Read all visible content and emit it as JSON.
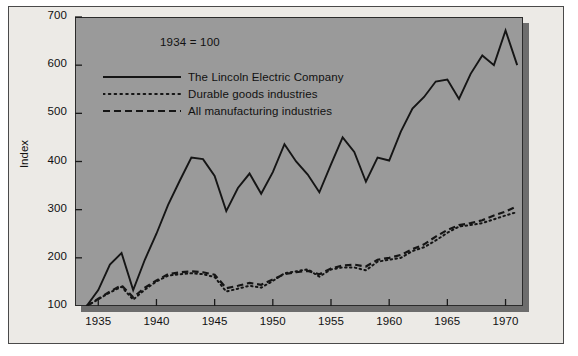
{
  "chart_data": {
    "type": "line",
    "title": "",
    "subtitle": "",
    "annotation": "1934 = 100",
    "xlabel": "",
    "ylabel": "Index",
    "xlim": [
      1933,
      1971.5
    ],
    "ylim": [
      100,
      700
    ],
    "grid": false,
    "legend_position": "upper-left-inside",
    "yticks": [
      100,
      200,
      300,
      400,
      500,
      600,
      700
    ],
    "xticks": [
      1935,
      1940,
      1945,
      1950,
      1955,
      1960,
      1965,
      1970
    ],
    "x": [
      1934,
      1935,
      1936,
      1937,
      1938,
      1939,
      1940,
      1941,
      1942,
      1943,
      1944,
      1945,
      1946,
      1947,
      1948,
      1949,
      1950,
      1951,
      1952,
      1953,
      1954,
      1955,
      1956,
      1957,
      1958,
      1959,
      1960,
      1961,
      1962,
      1963,
      1964,
      1965,
      1966,
      1967,
      1968,
      1969,
      1970,
      1971
    ],
    "series": [
      {
        "name": "The Lincoln Electric Company",
        "style": "solid",
        "color": "#151515",
        "values": [
          100,
          133,
          186,
          210,
          133,
          196,
          250,
          310,
          360,
          408,
          405,
          370,
          297,
          345,
          375,
          333,
          378,
          436,
          400,
          373,
          336,
          394,
          450,
          420,
          358,
          408,
          402,
          462,
          510,
          534,
          566,
          570,
          530,
          582,
          620,
          600,
          672,
          600
        ]
      },
      {
        "name": "Durable goods industries",
        "style": "dotted",
        "color": "#151515",
        "values": [
          100,
          114,
          128,
          140,
          113,
          134,
          151,
          163,
          166,
          168,
          166,
          160,
          130,
          136,
          142,
          138,
          152,
          168,
          172,
          176,
          161,
          176,
          180,
          180,
          174,
          192,
          196,
          200,
          214,
          222,
          236,
          252,
          265,
          268,
          272,
          280,
          288,
          295
        ]
      },
      {
        "name": "All manufacturing industries",
        "style": "dashed",
        "color": "#151515",
        "values": [
          100,
          115,
          130,
          143,
          118,
          138,
          153,
          166,
          170,
          172,
          170,
          165,
          137,
          142,
          148,
          144,
          155,
          166,
          170,
          173,
          166,
          178,
          184,
          186,
          182,
          196,
          200,
          206,
          218,
          228,
          244,
          258,
          268,
          272,
          278,
          288,
          296,
          307
        ]
      }
    ]
  },
  "axis": {
    "ylabel": "Index",
    "ytick_labels": [
      "700",
      "600",
      "500",
      "400",
      "300",
      "200",
      "100"
    ],
    "xtick_labels": [
      "1935",
      "1940",
      "1945",
      "1950",
      "1955",
      "1960",
      "1965",
      "1970"
    ]
  },
  "annotation": {
    "base_note": "1934 = 100"
  },
  "legend": {
    "entries": [
      {
        "label": "The Lincoln Electric Company",
        "style": "solid"
      },
      {
        "label": "Durable goods industries",
        "style": "dotted"
      },
      {
        "label": "All manufacturing industries",
        "style": "dashed"
      }
    ]
  }
}
